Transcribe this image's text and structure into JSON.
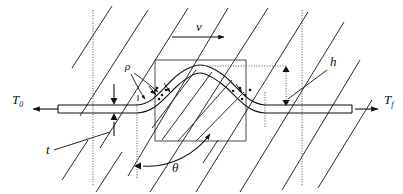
{
  "figure": {
    "type": "engineering-schematic",
    "background_color": "#ffffff",
    "line_color": "#111111",
    "dotted_line_color": "#555555"
  },
  "labels": {
    "tension_initial": {
      "symbol": "T",
      "subscript": "0",
      "name": "initial-tension"
    },
    "tension_final": {
      "symbol": "T",
      "subscript": "f",
      "name": "final-tension"
    },
    "velocity": {
      "symbol": "v",
      "name": "web-velocity"
    },
    "radius": {
      "symbol": "ρ",
      "name": "radius-of-curvature"
    },
    "height": {
      "symbol": "h",
      "name": "hump-height"
    },
    "thickness": {
      "symbol": "t",
      "name": "web-thickness"
    },
    "angle": {
      "symbol": "θ",
      "name": "wrap-angle"
    }
  },
  "annotations": {
    "left_arrow_direction": "left",
    "right_arrow_direction": "right",
    "velocity_arrow_direction": "right",
    "height_arrow_direction": "vertical-double",
    "thickness_arrow_direction": "vertical-double",
    "angle_arc_direction": "counterclockwise"
  },
  "geometry": {
    "web_left_x": 58,
    "web_right_x": 352,
    "web_center_y": 110,
    "web_thickness_px": 8,
    "hump_apex_x": 200,
    "hump_apex_y": 70,
    "box_left": 155,
    "box_right": 246,
    "box_top": 60,
    "box_bottom": 141,
    "dotted_vertical_left_x": 93,
    "dotted_vertical_right_x": 302,
    "dotted_vertical_mid_x": 137,
    "hatch_angle_deg": 58
  }
}
